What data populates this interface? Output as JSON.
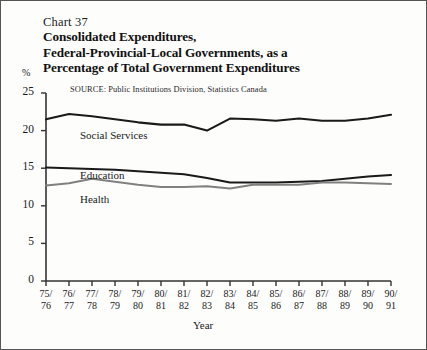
{
  "figure": {
    "chart_number": "Chart 37",
    "title_lines": [
      "Consolidated Expenditures,",
      "Federal-Provincial-Local Governments, as a",
      "Percentage of Total Government Expenditures"
    ],
    "source": "SOURCE:  Public Institutions Division, Statistics Canada",
    "y_unit": "%"
  },
  "chart_data": {
    "type": "line",
    "title": "Consolidated Expenditures, Federal-Provincial-Local Governments, as a Percentage of Total Government Expenditures",
    "subtitle": "Chart 37",
    "xlabel": "Year",
    "ylabel": "%",
    "ylim": [
      0,
      25
    ],
    "yticks": [
      0,
      5,
      10,
      15,
      20,
      25
    ],
    "grid": false,
    "legend": "inline-labels",
    "categories": [
      "75/\n76",
      "76/\n77",
      "77/\n78",
      "78/\n79",
      "79/\n80",
      "80/\n81",
      "81/\n82",
      "82/\n83",
      "83/\n84",
      "84/\n85",
      "85/\n86",
      "86/\n87",
      "87/\n88",
      "88/\n89",
      "89/\n90",
      "90/\n91"
    ],
    "categories_top": [
      "75/",
      "76/",
      "77/",
      "78/",
      "79/",
      "80/",
      "81/",
      "82/",
      "83/",
      "84/",
      "85/",
      "86/",
      "87/",
      "88/",
      "89/",
      "90/"
    ],
    "categories_bottom": [
      "76",
      "77",
      "78",
      "79",
      "80",
      "81",
      "82",
      "83",
      "84",
      "85",
      "86",
      "87",
      "88",
      "89",
      "90",
      "91"
    ],
    "series": [
      {
        "name": "Social Services",
        "color": "#1a1a1a",
        "values": [
          21.5,
          22.2,
          21.9,
          21.5,
          21.1,
          20.8,
          20.8,
          20.0,
          21.6,
          21.5,
          21.3,
          21.6,
          21.3,
          21.3,
          21.6,
          22.1
        ]
      },
      {
        "name": "Education",
        "color": "#1a1a1a",
        "values": [
          15.1,
          15.0,
          14.9,
          14.8,
          14.6,
          14.4,
          14.2,
          13.7,
          13.1,
          13.1,
          13.1,
          13.2,
          13.3,
          13.6,
          13.9,
          14.1
        ]
      },
      {
        "name": "Health",
        "color": "#808080",
        "values": [
          12.7,
          13.0,
          13.6,
          13.2,
          12.8,
          12.5,
          12.5,
          12.6,
          12.3,
          12.8,
          12.8,
          12.8,
          13.1,
          13.1,
          13.0,
          12.9
        ]
      }
    ],
    "series_label_positions": [
      {
        "name": "Social Services",
        "left": 79,
        "top": 128
      },
      {
        "name": "Education",
        "left": 79,
        "top": 168
      },
      {
        "name": "Health",
        "left": 79,
        "top": 192
      }
    ]
  }
}
